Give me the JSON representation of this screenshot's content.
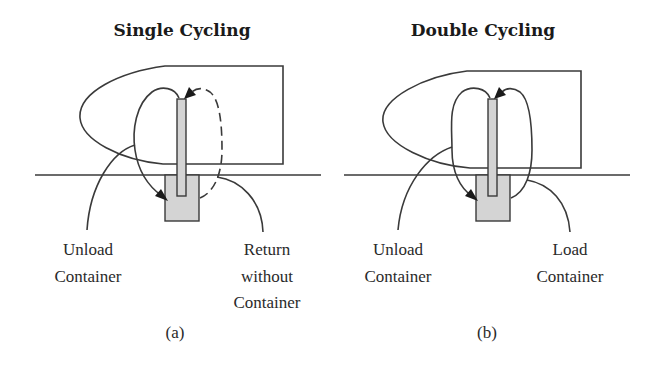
{
  "colors": {
    "line": "#3a3a3a",
    "fill_gray": "#d4d4d4",
    "text": "#2a2a2a",
    "background": "#ffffff"
  },
  "panels": [
    {
      "id": "a",
      "title": "Single Cycling",
      "caption": "(a)",
      "labels": {
        "left": [
          "Unload",
          "Container"
        ],
        "right": [
          "Return",
          "without",
          "Container"
        ]
      },
      "return_path_style": "dashed"
    },
    {
      "id": "b",
      "title": "Double Cycling",
      "caption": "(b)",
      "labels": {
        "left": [
          "Unload",
          "Container"
        ],
        "right": [
          "Load",
          "Container"
        ]
      },
      "return_path_style": "solid"
    }
  ]
}
